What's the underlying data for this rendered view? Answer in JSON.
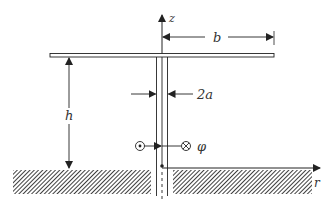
{
  "diagram": {
    "labels": {
      "z_axis": "z",
      "r_axis": "r",
      "top_radius": "b",
      "height": "h",
      "wire_diameter": "2a",
      "azimuth": "φ"
    },
    "symbols": {
      "out_of_page": "dot-in-circle-icon",
      "into_page": "cross-in-circle-icon"
    },
    "colors": {
      "line": "#222222",
      "ground_hatch": "#333333",
      "background": "#ffffff"
    }
  }
}
